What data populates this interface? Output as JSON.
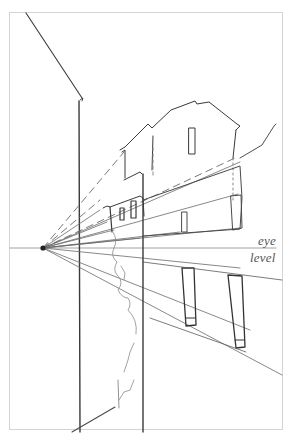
{
  "figure": {
    "type": "perspective sketch",
    "labels": {
      "eye": "eye",
      "level": "level"
    },
    "vanishing_point": {
      "x": 43,
      "y": 248
    },
    "eye_level_y": 248,
    "colors": {
      "paper": "#ffffff",
      "frame": "#d4d4d4",
      "pencil_dark": "#3a3a3a",
      "pencil_mid": "#6a6a6a",
      "pencil_light": "#9a9a9a"
    }
  }
}
